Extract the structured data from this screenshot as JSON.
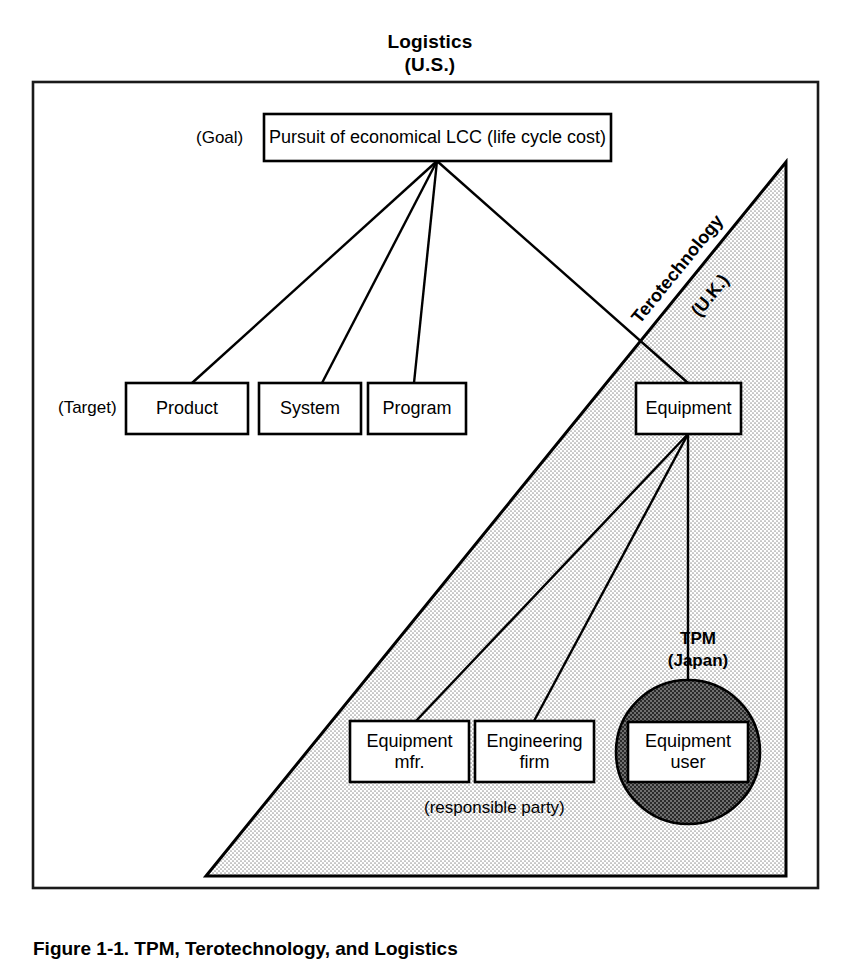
{
  "figure": {
    "title_line1": "Logistics",
    "title_line2": "(U.S.)",
    "caption": "Figure 1-1.  TPM, Terotechnology, and Logistics"
  },
  "row_labels": {
    "goal": "(Goal)",
    "target": "(Target)"
  },
  "regions": {
    "terotechnology": {
      "line1": "Terotechnology",
      "line2": "(U.K.)",
      "fill": "#e8e8e8",
      "stroke": "#000000"
    },
    "tpm": {
      "line1": "TPM",
      "line2": "(Japan)",
      "fill": "#8a8a8a",
      "stroke": "#000000"
    }
  },
  "boxes": {
    "goal": "Pursuit of economical LCC (life cycle cost)",
    "product": "Product",
    "system": "System",
    "program": "Program",
    "equipment": "Equipment",
    "equipment_mfr": "Equipment\nmfr.",
    "engineering_firm": "Engineering\nfirm",
    "equipment_user": "Equipment\nuser"
  },
  "notes": {
    "responsible_party": "(responsible party)"
  },
  "colors": {
    "frame": "#1a1a1a",
    "box_stroke": "#000000",
    "box_fill": "#ffffff",
    "text": "#000000"
  }
}
